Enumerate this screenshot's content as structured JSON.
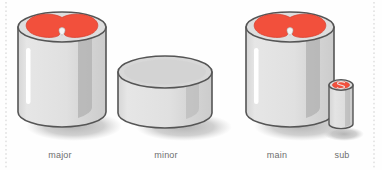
{
  "figure": {
    "title": "",
    "background_color": "#fefefe",
    "guides": {
      "name": "dotted-guide-line",
      "color": "#cfcfcf",
      "left_x": 6,
      "right_x": 374
    },
    "palette": {
      "outline": "#555555",
      "body_light": "#e2e2e2",
      "body_mid": "#d2d2d2",
      "body_shade": "#aeaeae",
      "highlight": "#ffffff",
      "rim_light": "#dcdcdc",
      "rim_dark": "#9a9a9a",
      "fill_red": "#f2503c",
      "fill_red_dark": "#d8402e",
      "notch_white": "#f4f4f4",
      "shadow": "#b4b4b4",
      "label_text": "#6e6e6e"
    },
    "objects": [
      {
        "id": "major",
        "label": "major",
        "shape": "tall-cylinder",
        "has_red_top": true,
        "top_motif": "heart",
        "relative_size": "large",
        "has_highlight_stripe": true
      },
      {
        "id": "minor",
        "label": "minor",
        "shape": "short-cylinder",
        "has_red_top": false,
        "top_motif": "none",
        "relative_size": "wide-flat",
        "has_highlight_stripe": false
      },
      {
        "id": "main",
        "label": "main",
        "shape": "tall-cylinder",
        "has_red_top": true,
        "top_motif": "heart",
        "relative_size": "large",
        "has_highlight_stripe": true
      },
      {
        "id": "sub",
        "label": "sub",
        "shape": "narrow-cylinder",
        "has_red_top": true,
        "top_motif": "swirl",
        "relative_size": "small",
        "has_highlight_stripe": false
      }
    ]
  }
}
